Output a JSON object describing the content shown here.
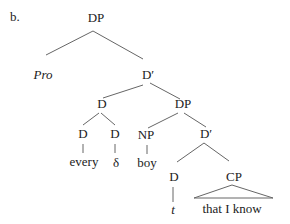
{
  "example_label": "b.",
  "tree": {
    "root": "DP",
    "pro": "Pro",
    "dbar1": "D′",
    "d_complex": "D",
    "dp2": "DP",
    "d_every": "D",
    "d_delta": "D",
    "np": "NP",
    "dbar2": "D′",
    "d_t": "D",
    "cp": "CP"
  },
  "leaves": {
    "every": "every",
    "delta": "δ",
    "boy": "boy",
    "trace": "t",
    "cp_content": "that I know"
  },
  "colors": {
    "line": "#555555",
    "text": "#222222"
  }
}
